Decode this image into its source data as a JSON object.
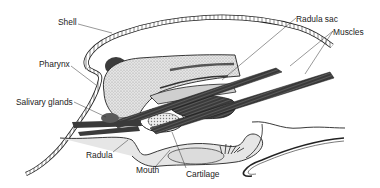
{
  "diagram": {
    "labels": [
      {
        "id": "shell",
        "text": "Shell",
        "x": 58,
        "y": 18
      },
      {
        "id": "pharynx",
        "text": "Pharynx",
        "x": 39,
        "y": 60
      },
      {
        "id": "salivary-glands",
        "text": "Salivary glands",
        "x": 16,
        "y": 98
      },
      {
        "id": "radula",
        "text": "Radula",
        "x": 86,
        "y": 151
      },
      {
        "id": "mouth",
        "text": "Mouth",
        "x": 136,
        "y": 166
      },
      {
        "id": "cartilage",
        "text": "Cartilage",
        "x": 186,
        "y": 170
      },
      {
        "id": "radula-sac",
        "text": "Radula sac",
        "x": 296,
        "y": 15
      },
      {
        "id": "muscles",
        "text": "Muscles",
        "x": 333,
        "y": 28
      }
    ],
    "colors": {
      "ink": "#222222",
      "tissue_fill": "#d9d9d9",
      "dark_tissue": "#4a4a4a",
      "background": "#ffffff"
    }
  }
}
